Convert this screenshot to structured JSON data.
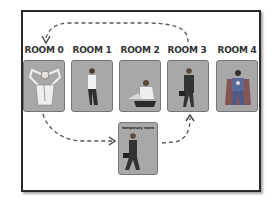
{
  "diagram": {
    "rooms": [
      {
        "label": "ROOM 0",
        "figure": "person-relaxing-hands-behind-head"
      },
      {
        "label": "ROOM 1",
        "figure": "person-standing"
      },
      {
        "label": "ROOM 2",
        "figure": "person-sitting-with-laptop"
      },
      {
        "label": "ROOM 3",
        "figure": "businessman-with-briefcase"
      },
      {
        "label": "ROOM 4",
        "figure": "superhero"
      }
    ],
    "temporary_room": {
      "label": "temporary room",
      "figure": "businessman-walking-with-briefcase"
    },
    "arrows": [
      {
        "from": "ROOM 3",
        "to": "ROOM 0",
        "style": "dashed",
        "path": "over-top"
      },
      {
        "from": "ROOM 0",
        "to": "temporary room",
        "style": "dashed"
      },
      {
        "from": "temporary room",
        "to": "ROOM 3",
        "style": "dashed"
      }
    ],
    "colors": {
      "room_fill": "#a8a8a8",
      "frame": "#2a2a2a",
      "arrow": "#555555"
    }
  }
}
